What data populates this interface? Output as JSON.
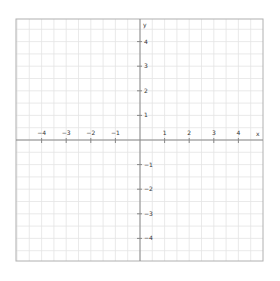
{
  "chart_data": {
    "type": "coordinate-plane",
    "title": "",
    "xlabel": "x",
    "ylabel": "y",
    "xlim": [
      -5,
      5
    ],
    "ylim": [
      -5,
      5
    ],
    "x_ticks": [
      -4,
      -3,
      -2,
      -1,
      1,
      2,
      3,
      4
    ],
    "y_ticks": [
      4,
      3,
      2,
      1,
      -1,
      -2,
      -3,
      -4
    ],
    "x_tick_labels": [
      "−4",
      "−3",
      "−2",
      "−1",
      "1",
      "2",
      "3",
      "4"
    ],
    "y_tick_labels": [
      "4",
      "3",
      "2",
      "1",
      "−1",
      "−2",
      "−3",
      "−4"
    ],
    "grid": true,
    "grid_step": 0.5,
    "series": []
  },
  "colors": {
    "background": "#ffffff",
    "grid": "#e4e4e4",
    "axis": "#888888",
    "border": "#b0b0b0",
    "label": "#333333"
  }
}
